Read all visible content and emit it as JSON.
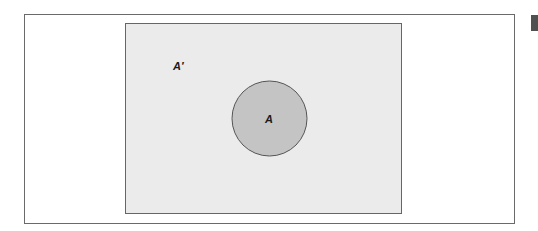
{
  "diagram": {
    "type": "venn",
    "universe": {
      "label": "A′",
      "fill": "#ebebeb",
      "stroke": "#666666"
    },
    "sets": [
      {
        "label": "A",
        "fill": "#c4c4c4",
        "stroke": "#555555"
      }
    ]
  },
  "colors": {
    "frame_border": "#6a6a6a",
    "background": "#ffffff",
    "edge_mark": "#505050"
  }
}
